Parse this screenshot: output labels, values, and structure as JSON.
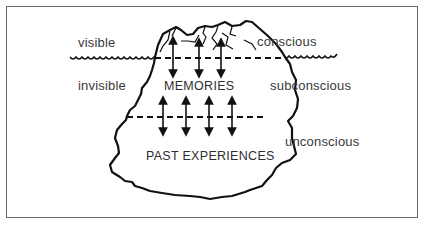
{
  "diagram": {
    "title": "",
    "type": "iceberg model of the mind",
    "left_labels": {
      "above_water": "visible",
      "below_water": "invisible"
    },
    "right_labels": {
      "top": "conscious",
      "middle": "subconscious",
      "bottom": "unconscious"
    },
    "inner_labels": {
      "upper": "MEMORIES",
      "lower": "PAST EXPERIENCES"
    },
    "colors": {
      "line": "#111111",
      "text": "#3a3a3a",
      "frame": "#6a6a6a",
      "background": "#ffffff"
    },
    "arrows": {
      "top_dashed_line_double_arrows": 3,
      "middle_dashed_line_double_arrows": 4
    }
  }
}
